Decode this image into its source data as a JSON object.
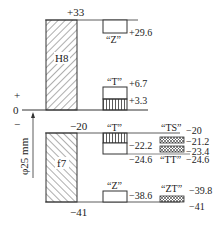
{
  "diagram": {
    "nominal_size_label": "φ25 mm",
    "zero_line_label": "0",
    "plus_label": "+",
    "minus_label": "−",
    "hole": {
      "name": "H8",
      "upper": "+33",
      "lower": "0"
    },
    "shaft": {
      "name": "f7",
      "upper": "−20",
      "lower": "−41"
    },
    "fits": [
      {
        "label": "“Z”",
        "value": "+29.6"
      },
      {
        "label": "“T”",
        "upper": "+6.7",
        "lower": "+3.3"
      },
      {
        "label": "“T”",
        "value": "−22.2",
        "lower": "−24.6"
      },
      {
        "label": "“TS”",
        "values": [
          "−20",
          "−21.2"
        ]
      },
      {
        "label": "“TT”",
        "values": [
          "−23.4",
          "−24.6"
        ]
      },
      {
        "label": "“Z”",
        "value": "−38.6"
      },
      {
        "label": "“ZT”",
        "values": [
          "−39.8",
          "−41"
        ]
      }
    ]
  }
}
